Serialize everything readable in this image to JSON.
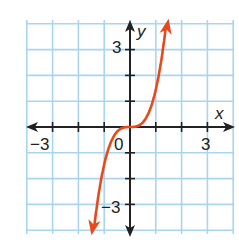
{
  "chart_data": {
    "type": "line",
    "title": "",
    "xlabel": "x",
    "ylabel": "y",
    "xlim": [
      -4,
      4
    ],
    "ylim": [
      -4,
      4
    ],
    "grid": true,
    "x_tick_labels": [
      "-3",
      "0",
      "3"
    ],
    "y_tick_labels": [
      "3",
      "-3"
    ],
    "origin_label": "0",
    "series": [
      {
        "name": "curve",
        "description": "cubic-like curve y = x^3 shape, arrows at both ends",
        "color": "#e8481c",
        "x": [
          -1.4,
          -1.2,
          -1.0,
          -0.8,
          -0.6,
          -0.4,
          -0.2,
          0,
          0.2,
          0.4,
          0.6,
          0.8,
          1.0,
          1.2,
          1.4
        ],
        "y": [
          -4.0,
          -2.6,
          -1.5,
          -0.8,
          -0.35,
          -0.1,
          -0.01,
          0,
          0.01,
          0.1,
          0.35,
          0.8,
          1.5,
          2.6,
          4.0
        ]
      }
    ]
  },
  "labels": {
    "x_axis": "x",
    "y_axis": "y",
    "x_neg3": "−3",
    "x_pos3": "3",
    "y_pos3": "3",
    "y_neg3": "−3",
    "origin": "0"
  },
  "colors": {
    "grid": "#a9d6ee",
    "axis": "#222222",
    "curve": "#e8481c"
  }
}
